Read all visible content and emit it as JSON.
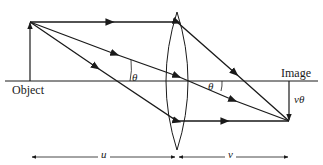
{
  "diagram": {
    "labels": {
      "object": "Object",
      "image": "Image",
      "theta_object_side": "θ",
      "theta_image_side": "θ",
      "image_height": "vθ",
      "object_distance": "u",
      "image_distance": "v"
    },
    "colors": {
      "line": "#1a1a1a",
      "background": "#ffffff"
    },
    "elements": {
      "optical_axis": {
        "x1": 5,
        "y1": 81,
        "x2": 318,
        "y2": 81
      },
      "object_arrow": {
        "x": 30,
        "base_y": 81,
        "tip_y": 22
      },
      "lens": {
        "center_x": 177,
        "top_y": 12,
        "bottom_y": 150,
        "half_width": 14
      },
      "image_arrow": {
        "x": 289,
        "base_y": 81,
        "tip_y": 121
      },
      "rays": [
        {
          "name": "parallel-ray",
          "points": [
            [
              30,
              22
            ],
            [
              177,
              22
            ],
            [
              289,
              121
            ]
          ]
        },
        {
          "name": "central-ray",
          "points": [
            [
              30,
              22
            ],
            [
              289,
              121
            ]
          ]
        },
        {
          "name": "focal-ray",
          "points": [
            [
              30,
              22
            ],
            [
              177,
              121
            ],
            [
              289,
              121
            ]
          ]
        }
      ],
      "dimension_u": {
        "x1": 30,
        "x2": 176,
        "y": 157
      },
      "dimension_v": {
        "x1": 178,
        "x2": 289,
        "y": 157
      }
    }
  }
}
